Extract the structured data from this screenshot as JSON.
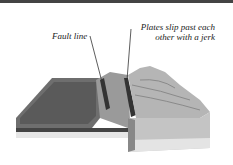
{
  "diagram": {
    "labels": {
      "fault_line": "Fault line",
      "plates_line1": "Plates slip past each",
      "plates_line2": "other with a jerk"
    }
  }
}
